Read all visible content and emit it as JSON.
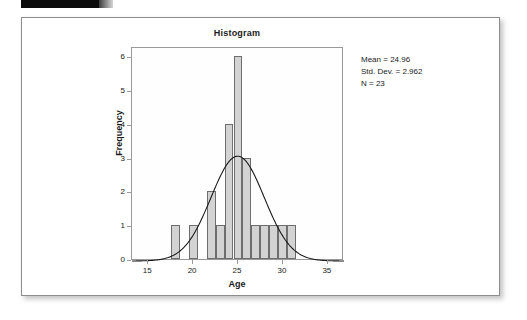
{
  "page": {
    "figure_label": ""
  },
  "chart_data": {
    "type": "bar",
    "title": "Histogram",
    "xlabel": "Age",
    "ylabel": "Frequency",
    "xlim": [
      13.2,
      36.8
    ],
    "ylim": [
      0,
      6.3
    ],
    "xticks": [
      15,
      20,
      25,
      30,
      35
    ],
    "yticks": [
      0,
      1,
      2,
      3,
      4,
      5,
      6
    ],
    "xtick_labels": [
      "15",
      "20",
      "25",
      "30",
      "35"
    ],
    "ytick_labels": [
      "0",
      "1",
      "2",
      "3",
      "4",
      "5",
      "6"
    ],
    "grid": false,
    "legend": "none",
    "bin_width": 1,
    "bins": [
      {
        "x0": 17.5,
        "x1": 18.5,
        "count": 1
      },
      {
        "x0": 19.5,
        "x1": 20.5,
        "count": 1
      },
      {
        "x0": 21.5,
        "x1": 22.5,
        "count": 2
      },
      {
        "x0": 22.5,
        "x1": 23.5,
        "count": 1
      },
      {
        "x0": 23.5,
        "x1": 24.5,
        "count": 4
      },
      {
        "x0": 24.5,
        "x1": 25.5,
        "count": 6
      },
      {
        "x0": 25.5,
        "x1": 26.5,
        "count": 3
      },
      {
        "x0": 26.5,
        "x1": 27.5,
        "count": 1
      },
      {
        "x0": 27.5,
        "x1": 28.5,
        "count": 1
      },
      {
        "x0": 28.5,
        "x1": 29.5,
        "count": 1
      },
      {
        "x0": 29.5,
        "x1": 30.5,
        "count": 1
      },
      {
        "x0": 30.5,
        "x1": 31.5,
        "count": 1
      }
    ],
    "normal_curve": {
      "mean": 24.96,
      "std_dev": 2.962,
      "n": 23,
      "peak_value": 3.1
    },
    "annotations": {
      "mean": "Mean = 24.96",
      "std_dev": "Std. Dev. = 2.962",
      "n": "N = 23"
    },
    "colors": {
      "bar_fill": "#d3d3d3",
      "bar_border": "#6e6e6e",
      "curve": "#1a1a1a",
      "axis": "#9a9a9a",
      "text": "#1a1a1a",
      "card_border": "#8d8d8d",
      "tab": "#0b0b0b"
    }
  }
}
